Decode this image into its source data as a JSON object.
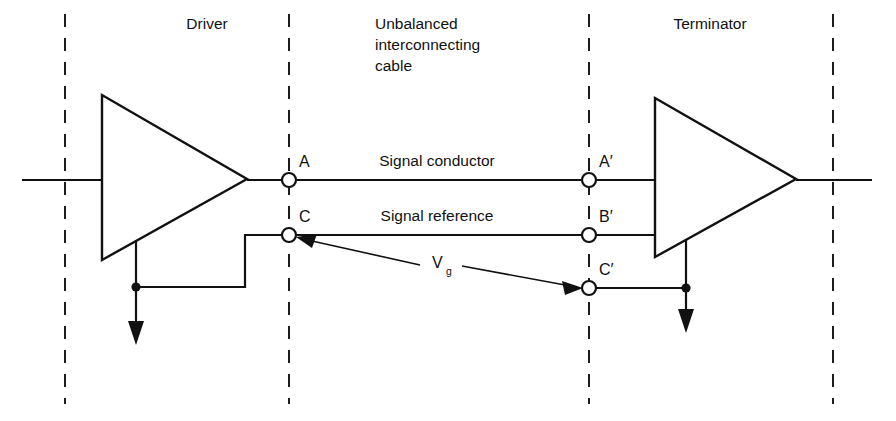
{
  "diagram": {
    "background_color": "#ffffff",
    "line_color": "#111111",
    "sections": {
      "driver": "Driver",
      "cable_line1": "Unbalanced",
      "cable_line2": "interconnecting",
      "cable_line3": "cable",
      "terminator": "Terminator"
    },
    "conductors": {
      "signal_conductor": "Signal conductor",
      "signal_reference": "Signal reference"
    },
    "nodes": {
      "a": "A",
      "c": "C",
      "a_prime": "A′",
      "b_prime": "B′",
      "c_prime": "C′"
    },
    "annotations": {
      "ground_voltage_symbol": "V",
      "ground_voltage_subscript": "g"
    },
    "icons": {
      "driver_amplifier": "triangle-amplifier-icon",
      "terminator_amplifier": "triangle-amplifier-icon",
      "driver_ground": "ground-arrow-icon",
      "terminator_ground": "ground-arrow-icon",
      "vg_leader": "double-arrow-leader-icon"
    }
  }
}
